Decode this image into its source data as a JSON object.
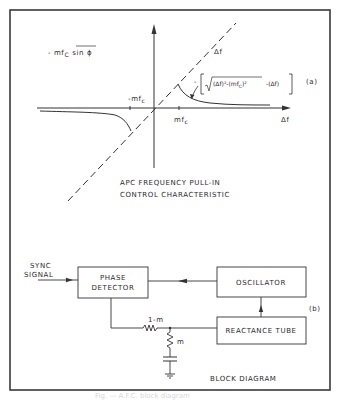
{
  "figure_a": {
    "label": "(a)",
    "y_axis_label_prefix": "- mf",
    "y_axis_label_sub": "C",
    "y_axis_label_over": "sin ϕ",
    "dashed_line_label": "Δf",
    "x_axis_label": "Δf",
    "neg_tick_label_prefix": "-mf",
    "neg_tick_label_sub": "c",
    "pos_tick_label_prefix": "mf",
    "pos_tick_label_sub": "c",
    "formula": "-[√(Δf)²-(mfᴄ)²  -(Δf)]",
    "formula_parts": {
      "minus": "-",
      "sqrt_body": "(Δf)²-(mf",
      "sqrt_sub": "C",
      "sqrt_tail": ")²",
      "tail": "-(Δf)"
    },
    "title_line1": "APC FREQUENCY  PULL-IN",
    "title_line2": "CONTROL  CHARACTERISTIC"
  },
  "figure_b": {
    "label": "(b)",
    "input_label_line1": "SYNC",
    "input_label_line2": "SIGNAL",
    "phase_detector_line1": "PHASE",
    "phase_detector_line2": "DETECTOR",
    "oscillator": "OSCILLATOR",
    "reactance_tube": "REACTANCE  TUBE",
    "resistor_series_label": "1-m",
    "resistor_shunt_label": "m",
    "title": "BLOCK DIAGRAM"
  },
  "caption": "Fig. — A.F.C. block diagram"
}
